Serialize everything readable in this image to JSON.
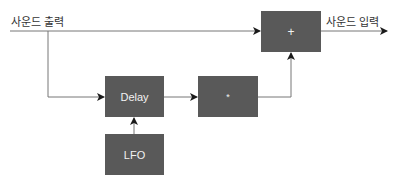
{
  "diagram": {
    "input_label": "사운드 출력",
    "output_label": "사운드 입력",
    "blocks": {
      "sum": {
        "label": "+"
      },
      "delay": {
        "label": "Delay"
      },
      "multiply": {
        "label": "*"
      },
      "lfo": {
        "label": "LFO"
      }
    },
    "colors": {
      "block_fill": "#595959",
      "block_text": "#f2f2f2",
      "line": "#777777",
      "arrow": "#1a1a1a"
    }
  }
}
